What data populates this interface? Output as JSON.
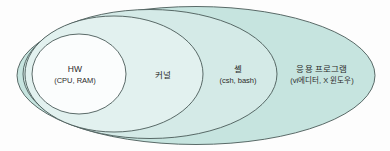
{
  "diagram": {
    "type": "nested-ellipses",
    "title": "",
    "background_color": "#fdfdfd",
    "stroke_color": "#4a5a58",
    "layers": [
      {
        "id": "hw",
        "name": "hardware",
        "title": "HW",
        "subtitle": "(CPU, RAM)",
        "fill": "#fbfdfd",
        "order": 1
      },
      {
        "id": "kernel",
        "name": "kernel",
        "title": "커널",
        "subtitle": "",
        "fill": "#e2f1ef",
        "order": 2
      },
      {
        "id": "shell",
        "name": "shell",
        "title": "셸",
        "subtitle": "(csh, bash)",
        "fill": "#d4eae7",
        "order": 3
      },
      {
        "id": "app",
        "name": "application-program",
        "title": "응용 프로그램",
        "subtitle": "(vi에디터, X 윈도우)",
        "fill": "#c6e4df",
        "order": 4
      }
    ]
  }
}
